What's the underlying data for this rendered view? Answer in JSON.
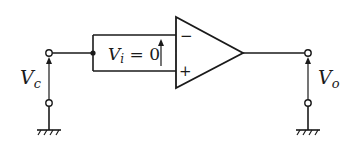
{
  "diagram": {
    "type": "op-amp circuit (inverting input driven, virtual short)",
    "labels": {
      "input_voltage": {
        "main": "V",
        "sub": "c"
      },
      "output_voltage": {
        "main": "V",
        "sub": "o"
      },
      "differential_voltage": {
        "main": "V",
        "sub": "i",
        "rest": " = 0"
      }
    },
    "opamp": {
      "inverting_sign": "−",
      "noninverting_sign": "+"
    },
    "colors": {
      "line": "#1a1a1a",
      "background": "#ffffff"
    }
  }
}
